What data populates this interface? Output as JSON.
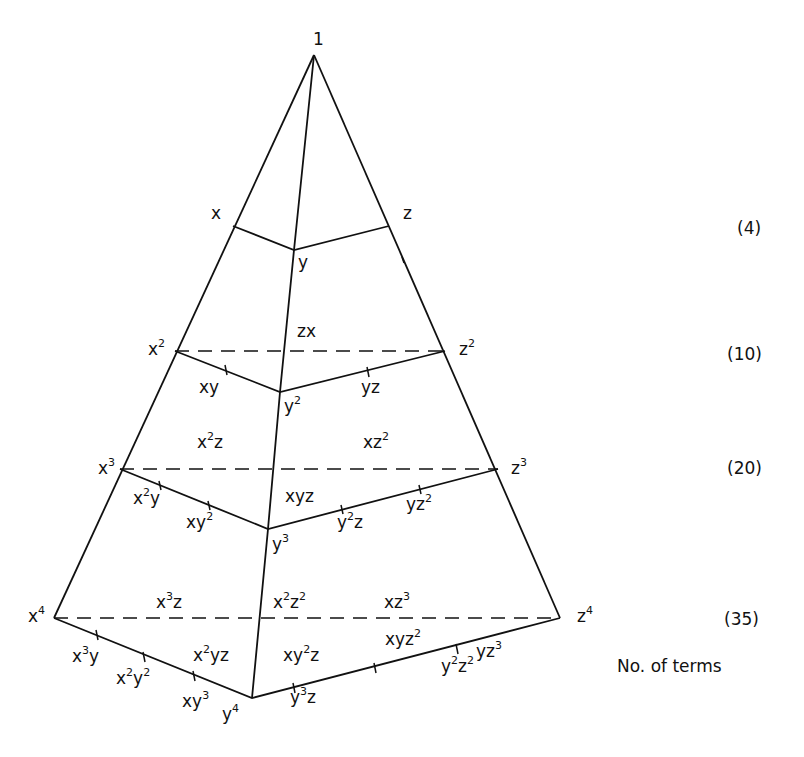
{
  "diagram": {
    "type": "monomial-pyramid",
    "apex_label": "1",
    "levels": [
      {
        "degree": 1,
        "count_label": "(4)",
        "corners": {
          "x": "x",
          "y": "y",
          "z": "z"
        },
        "terms": []
      },
      {
        "degree": 2,
        "count_label": "(10)",
        "corners": {
          "x": "x",
          "xsup": "2",
          "y": "y",
          "ysup": "2",
          "z": "z",
          "zsup": "2"
        },
        "terms": [
          "zx",
          "xy",
          "yz"
        ]
      },
      {
        "degree": 3,
        "count_label": "(20)",
        "corners": {
          "x": "x",
          "xsup": "3",
          "y": "y",
          "ysup": "3",
          "z": "z",
          "zsup": "3"
        },
        "terms": [
          "x2z",
          "xz2",
          "x2y",
          "xy2",
          "xyz",
          "y2z",
          "yz2"
        ]
      },
      {
        "degree": 4,
        "count_label": "(35)",
        "corners": {
          "x": "x",
          "xsup": "4",
          "y": "y",
          "ysup": "4",
          "z": "z",
          "zsup": "4"
        },
        "terms": [
          "x3z",
          "x2z2",
          "xz3",
          "x3y",
          "x2y2",
          "xy3",
          "x2yz",
          "xy2z",
          "xyz2",
          "yz3",
          "y2z2",
          "y3z"
        ]
      }
    ],
    "footer_label": "No. of terms",
    "colors": {
      "line": "#111111",
      "background": "#ffffff"
    }
  }
}
